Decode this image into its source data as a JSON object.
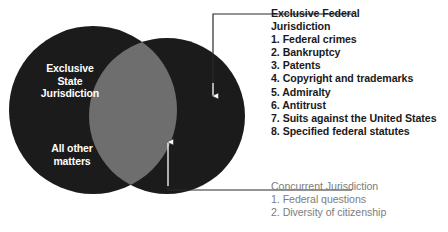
{
  "diagram": {
    "type": "venn-diagram",
    "title": "",
    "colors": {
      "exclusive_circle_fill": "#1b1b1b",
      "overlap_fill": "#6e6e6e",
      "background": "#ffffff",
      "federal_text": "#1a1a1a",
      "concurrent_text": "#7d7d7d",
      "circle_label_text": "#ffffff"
    },
    "state_circle": {
      "label_line_1": "Exclusive",
      "label_line_2": "State",
      "label_line_3": "Jurisdiction",
      "secondary_line_1": "All other",
      "secondary_line_2": "matters"
    }
  },
  "callouts": {
    "federal": {
      "heading_line_1": "Exclusive Federal",
      "heading_line_2": "Jurisdiction",
      "items": [
        "1. Federal crimes",
        "2. Bankruptcy",
        "3. Patents",
        "4. Copyright and trademarks",
        "5. Admiralty",
        "6. Antitrust",
        "7. Suits against the United States",
        "8. Specified federal statutes"
      ]
    },
    "concurrent": {
      "heading": "Concurrent Jurisdiction",
      "items": [
        "1. Federal questions",
        "2. Diversity of citizenship"
      ]
    }
  }
}
